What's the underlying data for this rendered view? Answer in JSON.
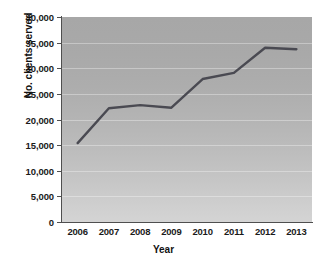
{
  "chart_data": {
    "type": "line",
    "title": "",
    "xlabel": "Year",
    "ylabel": "No. clients served",
    "categories": [
      "2006",
      "2007",
      "2008",
      "2009",
      "2010",
      "2011",
      "2012",
      "2013"
    ],
    "values": [
      15400,
      22200,
      22800,
      22300,
      27900,
      29100,
      34000,
      33700
    ],
    "series": [
      {
        "name": "No. clients served",
        "values": [
          15400,
          22200,
          22800,
          22300,
          27900,
          29100,
          34000,
          33700
        ]
      }
    ],
    "ylim": [
      0,
      40000
    ],
    "yticks": [
      0,
      5000,
      10000,
      15000,
      20000,
      25000,
      30000,
      35000,
      40000
    ],
    "ytick_labels": [
      "0",
      "5,000",
      "10,000",
      "15,000",
      "20,000",
      "25,000",
      "30,000",
      "35,000",
      "40,000"
    ],
    "grid": true,
    "legend": "none",
    "line_color": "#4a4a52",
    "plot_background_top": "#a7a7a7",
    "plot_background_bottom": "#d4d4d4",
    "axis_color": "#4f4f4f",
    "text_color": "#1a1a1a"
  }
}
